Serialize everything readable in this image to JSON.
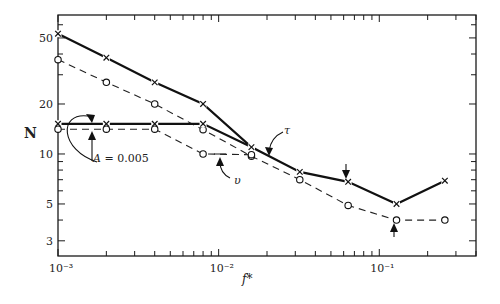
{
  "chart_data": {
    "type": "line",
    "title": "",
    "xlabel": "f*",
    "ylabel": "N",
    "xscale": "log",
    "yscale": "log",
    "xlim": [
      0.001,
      0.4
    ],
    "ylim": [
      2.43,
      68.7
    ],
    "grid": false,
    "x_tick_labels": [
      {
        "value": 0.001,
        "label": "10⁻³"
      },
      {
        "value": 0.01,
        "label": "10⁻²"
      },
      {
        "value": 0.1,
        "label": "10⁻¹"
      }
    ],
    "y_tick_labels": [
      {
        "value": 50,
        "label": "50"
      },
      {
        "value": 20,
        "label": "20"
      },
      {
        "value": 10,
        "label": "10"
      },
      {
        "value": 5,
        "label": "5"
      },
      {
        "value": 3,
        "label": "3"
      }
    ],
    "series": [
      {
        "name": "τ",
        "style": "solid",
        "marker": "x",
        "x": [
          0.001,
          0.002,
          0.004,
          0.008,
          0.016,
          0.032,
          0.064,
          0.128,
          0.256
        ],
        "values": [
          53,
          38,
          27,
          20,
          11,
          7.8,
          6.8,
          5.0,
          6.9
        ]
      },
      {
        "name": "υ",
        "style": "dashed",
        "marker": "o",
        "x": [
          0.001,
          0.002,
          0.004,
          0.008,
          0.016,
          0.032,
          0.064,
          0.128,
          0.256
        ],
        "values": [
          37,
          27,
          20,
          14,
          9.7,
          7.0,
          4.9,
          4.0,
          4.0
        ]
      },
      {
        "name": "τ (A = 0.005)",
        "style": "solid",
        "marker": "x",
        "x": [
          0.001,
          0.002,
          0.004,
          0.008,
          0.016
        ],
        "values": [
          15.2,
          15.2,
          15.2,
          15.2,
          11
        ]
      },
      {
        "name": "υ (A = 0.005)",
        "style": "dashed",
        "marker": "o",
        "x": [
          0.001,
          0.002,
          0.004,
          0.008,
          0.016
        ],
        "values": [
          14.1,
          14.1,
          14.1,
          10,
          9.9
        ]
      }
    ],
    "annotations": [
      {
        "text": "A = 0.005",
        "refers_to": "lower pair of curves"
      },
      {
        "text": "τ",
        "refers_to": "solid curves"
      },
      {
        "text": "υ",
        "refers_to": "dashed curves"
      },
      {
        "text": "↓",
        "refers_to": "τ point at f* = 0.064"
      },
      {
        "text": "↑",
        "refers_to": "υ minimum at f* = 0.128"
      }
    ]
  },
  "labels": {
    "ylabel": "N",
    "xlabel": "f*",
    "annot_A_prefix": "A",
    "annot_A_value": " = 0.005",
    "annot_tau": "τ",
    "annot_upsilon": "υ"
  }
}
